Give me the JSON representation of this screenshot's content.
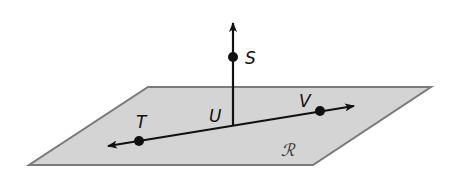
{
  "diagram": {
    "colors": {
      "plane_fill": "#d4d4d4",
      "plane_stroke": "#7a7a7a",
      "line": "#111111",
      "point": "#111111"
    },
    "plane": {
      "label": "ℛ",
      "corners": [
        [
          148,
          87
        ],
        [
          431,
          87
        ],
        [
          313,
          165
        ],
        [
          29,
          165
        ]
      ],
      "label_pos": [
        281,
        156
      ]
    },
    "line_TV": {
      "from_arrow_tip": [
        108,
        146
      ],
      "to_arrow_tip": [
        354,
        106
      ]
    },
    "ray_US": {
      "start": [
        233,
        125
      ],
      "arrow_tip": [
        233,
        23
      ]
    },
    "points": [
      {
        "name": "S",
        "label": "S",
        "x": 233,
        "y": 57,
        "label_x": 245,
        "label_y": 64,
        "dot": true
      },
      {
        "name": "T",
        "label": "T",
        "x": 139,
        "y": 141,
        "label_x": 136,
        "label_y": 128,
        "dot": true
      },
      {
        "name": "U",
        "label": "U",
        "x": 233,
        "y": 125,
        "label_x": 209,
        "label_y": 122,
        "dot": false
      },
      {
        "name": "V",
        "label": "V",
        "x": 320,
        "y": 111,
        "label_x": 299,
        "label_y": 107,
        "dot": true
      }
    ]
  }
}
